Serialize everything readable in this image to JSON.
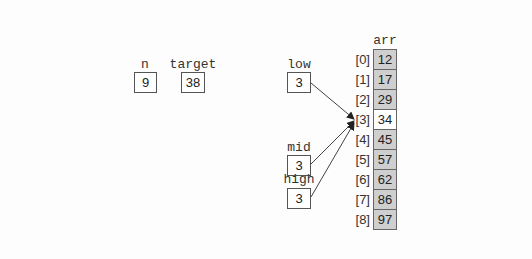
{
  "variables": {
    "n": {
      "label": "n",
      "value": "9"
    },
    "target": {
      "label": "target",
      "value": "38"
    },
    "low": {
      "label": "low",
      "value": "3"
    },
    "mid": {
      "label": "mid",
      "value": "3"
    },
    "high": {
      "label": "high",
      "value": "3"
    }
  },
  "array": {
    "name": "arr",
    "indices": [
      "[0]",
      "[1]",
      "[2]",
      "[3]",
      "[4]",
      "[5]",
      "[6]",
      "[7]",
      "[8]"
    ],
    "values": [
      "12",
      "17",
      "29",
      "34",
      "45",
      "57",
      "62",
      "86",
      "97"
    ],
    "highlighted_index": 3
  },
  "colors": {
    "cell_fill": "#cfcfcf",
    "highlight_fill": "#ffffff",
    "arrow": "#333333"
  }
}
